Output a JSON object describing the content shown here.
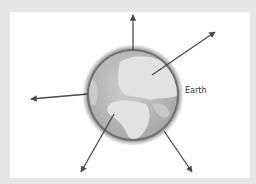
{
  "diagram": {
    "label": "Earth",
    "globe": {
      "cx": 133,
      "cy": 95,
      "r": 47
    },
    "arrows": [
      {
        "name": "up",
        "x1": 133,
        "y1": 50,
        "x2": 133,
        "y2": 15
      },
      {
        "name": "up-right",
        "x1": 152,
        "y1": 75,
        "x2": 215,
        "y2": 32
      },
      {
        "name": "left",
        "x1": 88,
        "y1": 94,
        "x2": 31,
        "y2": 99
      },
      {
        "name": "down-left",
        "x1": 114,
        "y1": 114,
        "x2": 81,
        "y2": 172
      },
      {
        "name": "down-right",
        "x1": 164,
        "y1": 131,
        "x2": 192,
        "y2": 172
      }
    ],
    "colors": {
      "arrow": "#4a4a4a",
      "globe_rim": "#6e6e6e",
      "ocean": "#b9b9b9",
      "land": "#dcdcdc",
      "frame": "#e6e6e6"
    }
  }
}
